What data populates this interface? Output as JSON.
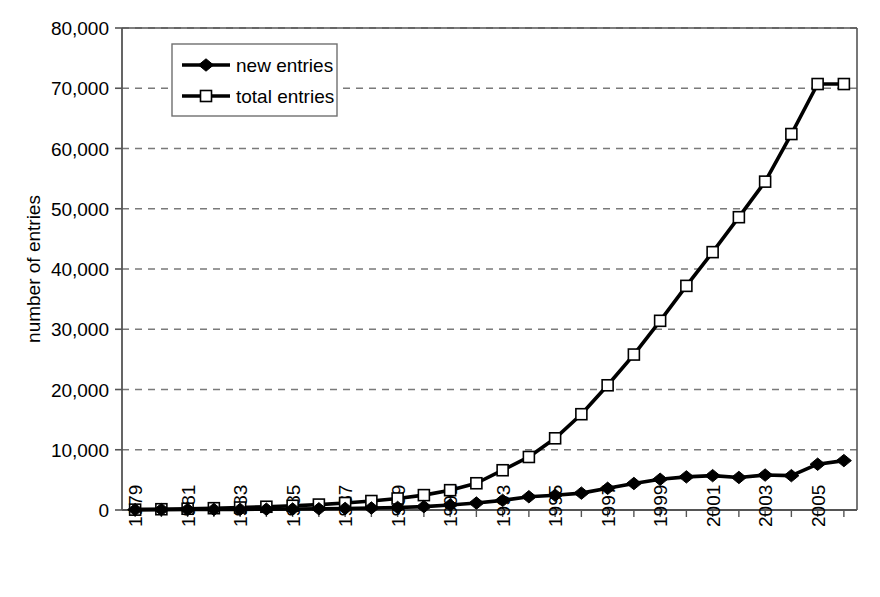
{
  "chart_data": {
    "type": "line",
    "title": "",
    "subtitle": "",
    "xlabel": "",
    "ylabel": "number of entries",
    "x": [
      1979,
      1980,
      1981,
      1982,
      1983,
      1984,
      1985,
      1986,
      1987,
      1988,
      1989,
      1990,
      1991,
      1992,
      1993,
      1994,
      1995,
      1996,
      1997,
      1998,
      1999,
      2000,
      2001,
      2002,
      2003,
      2004,
      2005,
      2006
    ],
    "xtick_labels": [
      "1979",
      "1981",
      "1983",
      "1985",
      "1987",
      "1989",
      "1991",
      "1993",
      "1995",
      "1997",
      "1999",
      "2001",
      "2003",
      "2005"
    ],
    "xtick_values": [
      1979,
      1981,
      1983,
      1985,
      1987,
      1989,
      1991,
      1993,
      1995,
      1997,
      1999,
      2001,
      2003,
      2005
    ],
    "ytick_labels": [
      "0",
      "10,000",
      "20,000",
      "30,000",
      "40,000",
      "50,000",
      "60,000",
      "70,000",
      "80,000"
    ],
    "ytick_values": [
      0,
      10000,
      20000,
      30000,
      40000,
      50000,
      60000,
      70000,
      80000
    ],
    "xlim": [
      1978.5,
      2006.5
    ],
    "ylim": [
      0,
      80000
    ],
    "grid": "horizontal-dashed",
    "legend_position": "top-left-inside",
    "series": [
      {
        "name": "new entries",
        "marker": "filled-diamond",
        "color": "#000000",
        "values": [
          60,
          70,
          80,
          90,
          110,
          130,
          160,
          200,
          260,
          330,
          420,
          560,
          820,
          1150,
          1600,
          2200,
          2450,
          2800,
          3600,
          4400,
          5100,
          5500,
          5700,
          5400,
          5800,
          5700,
          7600,
          8200
        ]
      },
      {
        "name": "total entries",
        "marker": "open-square",
        "color": "#000000",
        "values": [
          60,
          130,
          210,
          300,
          410,
          540,
          700,
          900,
          1160,
          1490,
          1910,
          2470,
          3290,
          4440,
          6600,
          8800,
          11900,
          15900,
          20700,
          25800,
          31400,
          37200,
          42800,
          48600,
          54500,
          62400,
          70700,
          70700
        ]
      }
    ]
  },
  "legend": {
    "items": [
      {
        "label": "new entries",
        "marker": "filled-diamond"
      },
      {
        "label": "total entries",
        "marker": "open-square"
      }
    ]
  },
  "axes": {
    "y_title": "number of entries"
  },
  "colors": {
    "line": "#000000",
    "grid": "#7a7a7a",
    "axis": "#555555",
    "background": "#ffffff",
    "marker_fill_open": "#ffffff"
  }
}
